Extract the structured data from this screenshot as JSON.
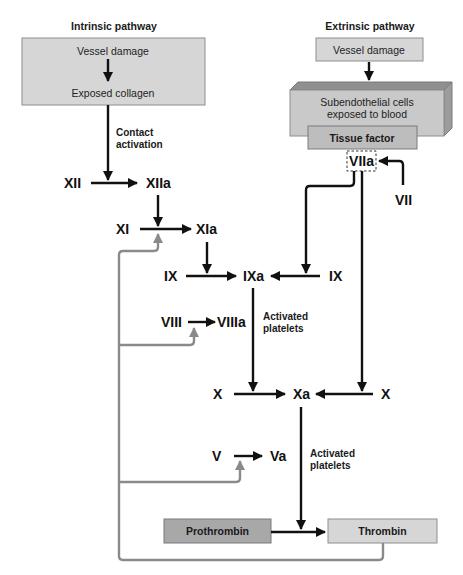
{
  "diagram": {
    "intrinsic": {
      "title": "Intrinsic pathway",
      "box_line1": "Vessel damage",
      "box_line2": "Exposed collagen",
      "contact_label_line1": "Contact",
      "contact_label_line2": "activation"
    },
    "extrinsic": {
      "title": "Extrinsic pathway",
      "vessel_damage": "Vessel damage",
      "subendothelial_line1": "Subendothelial cells",
      "subendothelial_line2": "exposed to blood",
      "tissue_factor": "Tissue factor",
      "factor_viia": "VIIa",
      "factor_vii": "VII"
    },
    "factors": {
      "xii": "XII",
      "xiia": "XIIa",
      "xi": "XI",
      "xia": "XIa",
      "ix_left": "IX",
      "ixa": "IXa",
      "ix_right": "IX",
      "viii": "VIII",
      "viiia": "VIIIa",
      "x_left": "X",
      "xa": "Xa",
      "x_right": "X",
      "v": "V",
      "va": "Va"
    },
    "labels": {
      "activated_platelets_1_line1": "Activated",
      "activated_platelets_1_line2": "platelets",
      "activated_platelets_2_line1": "Activated",
      "activated_platelets_2_line2": "platelets"
    },
    "common": {
      "prothrombin": "Prothrombin",
      "thrombin": "Thrombin"
    },
    "colors": {
      "pathway_arrow": "#111111",
      "thrombin_feedback_arrow": "#8a8a8a",
      "box_fill_light": "#d6d6d6",
      "box_fill_dark": "#a8a8a8"
    }
  }
}
